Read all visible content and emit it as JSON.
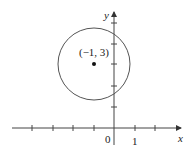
{
  "diagram": {
    "type": "coordinate-plane-circle",
    "axes": {
      "x_label": "x",
      "y_label": "y",
      "origin_label": "0",
      "x_tick_label": "1",
      "x_ticks": [
        -4,
        -3,
        -2,
        -1,
        1,
        2
      ],
      "y_ticks": [
        1,
        2,
        3,
        4,
        5
      ]
    },
    "circle": {
      "center": [
        -1,
        3
      ],
      "center_label": "(−1, 3)",
      "radius": 1.75
    },
    "colors": {
      "axis": "#444444",
      "circle": "#555555",
      "text": "#222222"
    }
  }
}
